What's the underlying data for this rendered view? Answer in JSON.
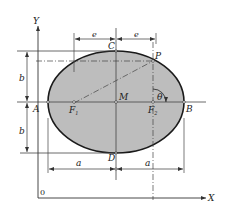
{
  "diagram": {
    "type": "ellipse-geometry",
    "colors": {
      "fill": "#bdbdbd",
      "stroke": "#1a1a1a",
      "line": "#444444"
    },
    "axes": {
      "x_label": "X",
      "y_label": "Y",
      "origin_label": "0"
    },
    "points": {
      "A": "A",
      "B": "B",
      "C": "C",
      "D": "D",
      "M": "M",
      "P": "P",
      "F1": "F",
      "F1_sub": "1",
      "F2": "F",
      "F2_sub": "2"
    },
    "angle_label": "θ",
    "dimensions": {
      "e_left": "e",
      "e_right": "e",
      "b_top": "b",
      "b_bottom": "b",
      "a_left": "a",
      "a_right": "a"
    }
  }
}
